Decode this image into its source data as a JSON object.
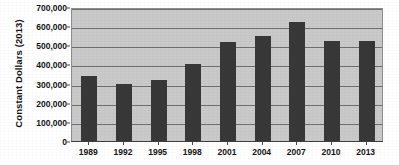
{
  "chart_data": {
    "type": "bar",
    "title": "",
    "subtitle": "",
    "xlabel": "",
    "ylabel": "Constant Dollars (2013)",
    "categories": [
      "1989",
      "1992",
      "1995",
      "1998",
      "2001",
      "2004",
      "2007",
      "2010",
      "2013"
    ],
    "values": [
      340000,
      300000,
      320000,
      400000,
      515000,
      548000,
      620000,
      520000,
      520000
    ],
    "series": [
      {
        "name": "Constant Dollars (2013)",
        "values": [
          340000,
          300000,
          320000,
          400000,
          515000,
          548000,
          620000,
          520000,
          520000
        ]
      }
    ],
    "ylim": [
      0,
      700000
    ],
    "ytick_values": [
      0,
      100000,
      200000,
      300000,
      400000,
      500000,
      600000,
      700000
    ],
    "ytick_labels": [
      "0",
      "100,000",
      "200,000",
      "300,000",
      "400,000",
      "500,000",
      "600,000",
      "700,000"
    ],
    "xtick_labels": [
      "1989",
      "1992",
      "1995",
      "1998",
      "2001",
      "2004",
      "2007",
      "2010",
      "2013"
    ],
    "grid": true,
    "grid_axis": "y",
    "legend": false,
    "legend_position": "none",
    "annotations": [],
    "colors": {
      "bar_fill": "#383838",
      "plot_background": "#c9c9c9",
      "gridline": "#6f6f6f",
      "axis_line": "#3d3d3d",
      "text": "#141414",
      "page_background": "#ffffff"
    }
  }
}
